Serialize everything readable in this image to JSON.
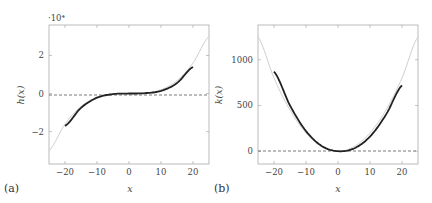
{
  "chart_data": [
    {
      "panel_label": "(a)",
      "type": "line",
      "title": "",
      "xlabel": "x",
      "ylabel": "h(x)",
      "y_scale_note": "·10⁴",
      "xlim": [
        -25,
        25
      ],
      "ylim": [
        -3.7,
        3.6
      ],
      "xticks": [
        -20,
        -10,
        0,
        10,
        20
      ],
      "xtick_labels": [
        "−20",
        "−10",
        "0",
        "10",
        "20"
      ],
      "yticks": [
        -2,
        0,
        2
      ],
      "ytick_labels": [
        "−2",
        "0",
        "2"
      ],
      "grid": false,
      "reference_line": {
        "y": 0,
        "style": "dashed"
      },
      "series": [
        {
          "name": "reference (gray)",
          "color": "#c8c8c8",
          "x": [
            -25,
            -20,
            -15,
            -10,
            -5,
            0,
            5,
            10,
            15,
            20,
            25
          ],
          "values": [
            -3.0,
            -1.6,
            -0.68,
            -0.2,
            -0.025,
            0,
            0.025,
            0.2,
            0.68,
            1.6,
            3.0
          ]
        },
        {
          "name": "fit (black)",
          "color": "#222222",
          "x": [
            -20,
            -15,
            -10,
            -5,
            0,
            5,
            10,
            15,
            20
          ],
          "values": [
            -1.7,
            -0.75,
            -0.22,
            -0.03,
            0.0,
            0.02,
            0.14,
            0.55,
            1.4
          ]
        }
      ]
    },
    {
      "panel_label": "(b)",
      "type": "line",
      "title": "",
      "xlabel": "x",
      "ylabel": "k(x)",
      "xlim": [
        -25,
        25
      ],
      "ylim": [
        -140,
        1380
      ],
      "xticks": [
        -20,
        -10,
        0,
        10,
        20
      ],
      "xtick_labels": [
        "−20",
        "−10",
        "0",
        "10",
        "20"
      ],
      "yticks": [
        0,
        500,
        1000
      ],
      "ytick_labels": [
        "0",
        "500",
        "1000"
      ],
      "grid": false,
      "reference_line": {
        "y": 0,
        "style": "dashed"
      },
      "series": [
        {
          "name": "reference (gray)",
          "color": "#c8c8c8",
          "x": [
            -25,
            -20,
            -15,
            -10,
            -5,
            0,
            5,
            10,
            15,
            20,
            25
          ],
          "values": [
            1250,
            800,
            450,
            200,
            50,
            0,
            50,
            200,
            450,
            800,
            1250
          ]
        },
        {
          "name": "fit (black)",
          "color": "#222222",
          "x": [
            -20,
            -15,
            -10,
            -5,
            0,
            5,
            10,
            15,
            20
          ],
          "values": [
            870,
            500,
            220,
            55,
            0,
            30,
            160,
            400,
            720
          ]
        }
      ]
    }
  ]
}
